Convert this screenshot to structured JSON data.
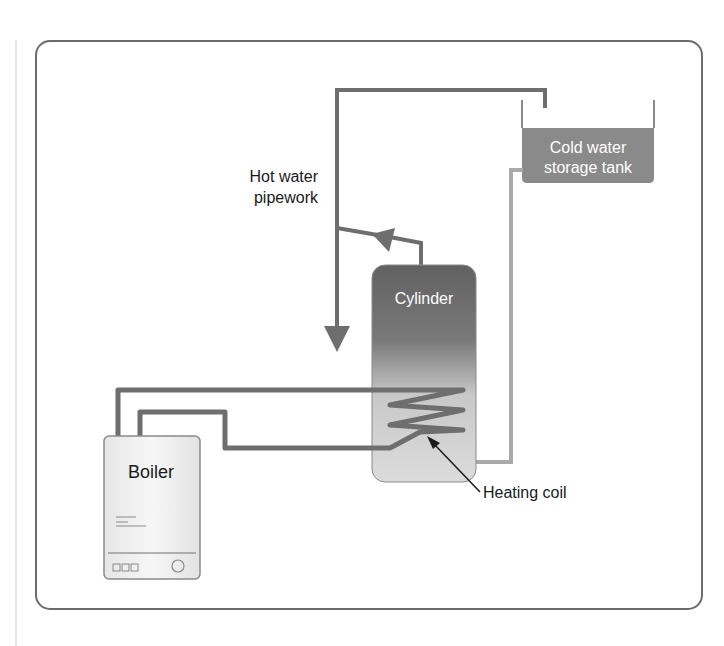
{
  "diagram": {
    "labels": {
      "hot_water_pipework_line1": "Hot water",
      "hot_water_pipework_line2": "pipework",
      "cold_tank_line1": "Cold water",
      "cold_tank_line2": "storage tank",
      "cylinder": "Cylinder",
      "boiler": "Boiler",
      "heating_coil": "Heating coil"
    },
    "components": [
      "Cold water storage tank",
      "Cylinder",
      "Boiler",
      "Heating coil",
      "Hot water pipework"
    ],
    "colors": {
      "frame": "#6b6b6b",
      "pipe_dark": "#6e6e6e",
      "pipe_light": "#a9a9a9",
      "tank_fill": "#8a8a8a",
      "cylinder_top": "#666666",
      "cylinder_bottom": "#d9d9d9",
      "boiler_fill": "#f0f0f0",
      "text_dark": "#1a1a1a",
      "text_light": "#ffffff"
    }
  }
}
